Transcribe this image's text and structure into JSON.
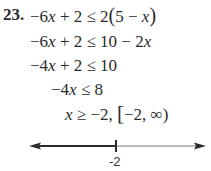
{
  "problem": {
    "number": "23.",
    "steps": [
      {
        "parts": [
          "−6",
          "x",
          " + 2 ≤ 2",
          "(",
          "5 − ",
          "x",
          ")"
        ]
      },
      {
        "parts": [
          "−6",
          "x",
          " + 2 ≤ 10 − 2",
          "x"
        ]
      },
      {
        "parts": [
          "−4",
          "x",
          " + 2 ≤ 10"
        ]
      },
      {
        "parts": [
          "−4",
          "x",
          " ≤ 8"
        ]
      },
      {
        "parts": [
          "x",
          " ≥ −2, ",
          "[",
          "−2, ∞)"
        ]
      }
    ]
  },
  "number_line": {
    "tick_label": "-2",
    "tick_value": -2,
    "shaded_direction": "left",
    "arrows": [
      "left",
      "right"
    ],
    "colors": {
      "thick_segment": "#2b2b2b",
      "thin_segment": "#777777"
    }
  }
}
